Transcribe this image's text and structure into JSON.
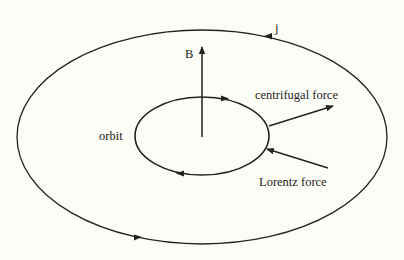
{
  "diagram": {
    "labels": {
      "current": "j",
      "field": "B",
      "centrifugal": "centrifugal force",
      "orbit": "orbit",
      "lorentz": "Lorentz force"
    },
    "colors": {
      "background": "#fdfdf8",
      "stroke": "#222222"
    }
  }
}
